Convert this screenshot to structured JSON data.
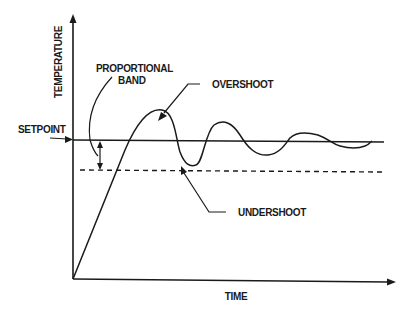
{
  "diagram": {
    "title": "",
    "axes": {
      "y_label": "TEMPERATURE",
      "x_label": "TIME"
    },
    "labels": {
      "setpoint": "SETPOINT",
      "proportional_band_line1": "PROPORTIONAL",
      "proportional_band_line2": "BAND",
      "overshoot": "OVERSHOOT",
      "undershoot": "UNDERSHOOT"
    },
    "colors": {
      "ink": "#1a1a1a",
      "background": "#ffffff"
    }
  }
}
